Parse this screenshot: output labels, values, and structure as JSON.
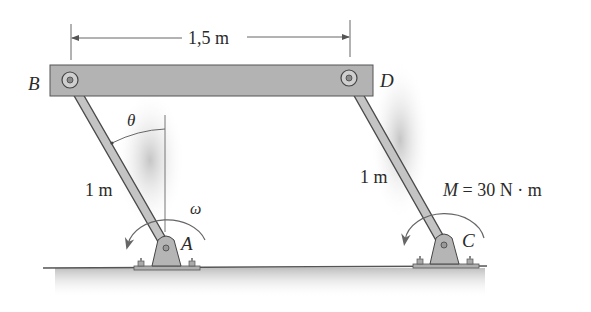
{
  "figure": {
    "type": "four-bar linkage (parallel links)",
    "dimension": {
      "label": "1,5 m",
      "description": "horizontal distance between pins B and D"
    },
    "points": {
      "B": {
        "label": "B"
      },
      "D": {
        "label": "D"
      },
      "A": {
        "label": "A"
      },
      "C": {
        "label": "C"
      }
    },
    "links": {
      "AB": {
        "length_label": "1 m"
      },
      "CD": {
        "length_label": "1 m"
      }
    },
    "angle": {
      "symbol": "θ",
      "description": "angle of link AB from vertical"
    },
    "angular_velocity": {
      "symbol": "ω",
      "at": "A",
      "direction": "counterclockwise"
    },
    "moment": {
      "label": "M = 30 N · m",
      "at": "C",
      "direction": "counterclockwise",
      "value": 30,
      "unit": "N · m"
    }
  },
  "colors": {
    "bar_fill": "#b3b3b3",
    "link_fill": "#c4c4c4",
    "outline": "#4a4a4a",
    "text": "#2a2a2a",
    "shadow": "#d0d0d0"
  }
}
